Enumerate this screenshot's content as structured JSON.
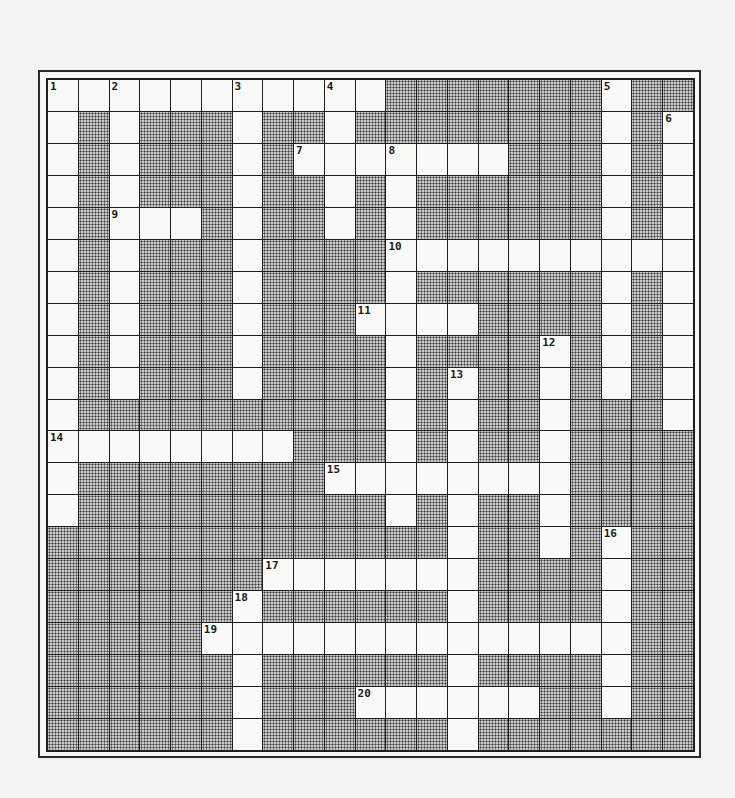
{
  "puzzle": {
    "type": "crossword",
    "rows": 21,
    "cols": 21,
    "layout": [
      "...........#######.##",
      ".#.###.##.########.#.",
      ".#.###.#.......###.#.",
      ".#.###.##.#.######.#.",
      ".#...#.##.#.######.#.",
      ".#.###.####..........",
      ".#.###.####.######.#.",
      ".#.###.###....####.#.",
      ".#.###.####.####.#.#.",
      ".#.###.####.#.##.#.#.",
      ".##########.#.##.###.",
      "........###.#.##.####",
      ".########........####",
      ".##########.#.##.####",
      "#############.##.#.##",
      "#######.......####.##",
      "######.######.####.##",
      "#####..............##",
      "######.######.####.##",
      "######.###......##.##",
      "######.######.#######"
    ],
    "numbers": [
      {
        "n": "1",
        "row": 0,
        "col": 0
      },
      {
        "n": "2",
        "row": 0,
        "col": 2
      },
      {
        "n": "3",
        "row": 0,
        "col": 6
      },
      {
        "n": "4",
        "row": 0,
        "col": 9
      },
      {
        "n": "5",
        "row": 0,
        "col": 18
      },
      {
        "n": "6",
        "row": 1,
        "col": 20
      },
      {
        "n": "7",
        "row": 2,
        "col": 8
      },
      {
        "n": "8",
        "row": 2,
        "col": 11
      },
      {
        "n": "9",
        "row": 4,
        "col": 2
      },
      {
        "n": "10",
        "row": 5,
        "col": 11
      },
      {
        "n": "11",
        "row": 7,
        "col": 10
      },
      {
        "n": "12",
        "row": 8,
        "col": 16
      },
      {
        "n": "13",
        "row": 9,
        "col": 13
      },
      {
        "n": "14",
        "row": 11,
        "col": 0
      },
      {
        "n": "15",
        "row": 12,
        "col": 9
      },
      {
        "n": "16",
        "row": 14,
        "col": 18
      },
      {
        "n": "17",
        "row": 15,
        "col": 7
      },
      {
        "n": "18",
        "row": 16,
        "col": 6
      },
      {
        "n": "19",
        "row": 17,
        "col": 5
      },
      {
        "n": "20",
        "row": 19,
        "col": 10
      }
    ],
    "colors": {
      "open_cell": "#f8f8f6",
      "block_cell": "#8a8a8a",
      "grid_line": "#1e1e1e"
    }
  }
}
